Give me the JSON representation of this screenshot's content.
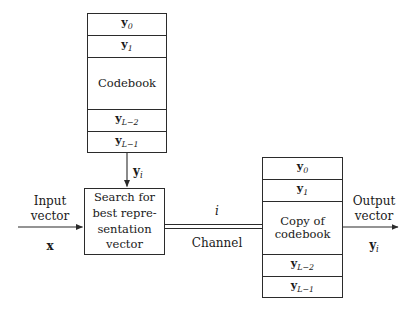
{
  "figure": {
    "type": "block-diagram"
  },
  "encoder_codebook": {
    "title": "Codebook",
    "rows": [
      {
        "label": "y",
        "sub": "0"
      },
      {
        "label": "y",
        "sub": "1"
      },
      {
        "label": "y",
        "sub": "L−2"
      },
      {
        "label": "y",
        "sub": "L−1"
      }
    ]
  },
  "decoder_codebook": {
    "title_line1": "Copy of",
    "title_line2": "codebook",
    "rows": [
      {
        "label": "y",
        "sub": "0"
      },
      {
        "label": "y",
        "sub": "1"
      },
      {
        "label": "y",
        "sub": "L−2"
      },
      {
        "label": "y",
        "sub": "L−1"
      }
    ]
  },
  "search_block": {
    "line1": "Search for",
    "line2": "best repre-",
    "line3": "sentation",
    "line4": "vector"
  },
  "labels": {
    "input_line1": "Input",
    "input_line2": "vector",
    "input_symbol": "x",
    "output_line1": "Output",
    "output_line2": "vector",
    "output_symbol": "y",
    "output_symbol_sub": "i",
    "codeword_symbol": "y",
    "codeword_symbol_sub": "i",
    "index_symbol": "i",
    "channel": "Channel"
  },
  "colors": {
    "stroke": "#2b2b2b",
    "background": "#ffffff",
    "text": "#1a1a1a"
  }
}
